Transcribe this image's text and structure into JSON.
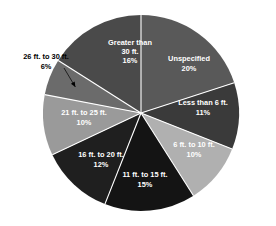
{
  "chart_data": {
    "type": "pie",
    "title": "",
    "subtitle": "",
    "xlabel": "",
    "ylabel": "",
    "legend_position": "none",
    "grid": false,
    "units": "percent",
    "start_angle_deg": -90,
    "direction": "clockwise",
    "categories": [
      "Unspecified",
      "Less than 6 ft.",
      "6 ft. to 10 ft.",
      "11 ft. to 15 ft.",
      "16 ft. to 20 ft.",
      "21 ft. to 25 ft.",
      "26 ft. to 30 ft.",
      "Greater than 30 ft."
    ],
    "values": [
      20,
      11,
      10,
      15,
      12,
      10,
      6,
      16
    ],
    "value_labels": [
      "20%",
      "11%",
      "10%",
      "15%",
      "12%",
      "10%",
      "6%",
      "16%"
    ],
    "colors": [
      "#595959",
      "#3a3a3a",
      "#b0b0b0",
      "#141414",
      "#1f1f1f",
      "#9a9a9a",
      "#6b6b6b",
      "#4a4a4a"
    ],
    "slices": [
      {
        "name": "Unspecified",
        "value": 20,
        "value_label": "20%",
        "label_lines": [
          "Unspecified",
          "20%"
        ],
        "color": "#595959",
        "label_placement": "inside",
        "label_x": 189,
        "label_y": 64
      },
      {
        "name": "Less than 6 ft.",
        "value": 11,
        "value_label": "11%",
        "label_lines": [
          "Less than 6 ft.",
          "11%"
        ],
        "color": "#3a3a3a",
        "label_placement": "inside",
        "label_x": 203,
        "label_y": 108
      },
      {
        "name": "6 ft. to 10 ft.",
        "value": 10,
        "value_label": "10%",
        "label_lines": [
          "6 ft. to 10 ft.",
          "10%"
        ],
        "color": "#b0b0b0",
        "label_placement": "inside",
        "label_x": 194,
        "label_y": 150
      },
      {
        "name": "11 ft. to 15 ft.",
        "value": 15,
        "value_label": "15%",
        "label_lines": [
          "11 ft. to 15 ft.",
          "15%"
        ],
        "color": "#141414",
        "label_placement": "inside",
        "label_x": 145,
        "label_y": 180
      },
      {
        "name": "16 ft. to 20 ft.",
        "value": 12,
        "value_label": "12%",
        "label_lines": [
          "16 ft. to 20 ft.",
          "12%"
        ],
        "color": "#1f1f1f",
        "label_placement": "inside",
        "label_x": 101,
        "label_y": 160
      },
      {
        "name": "21 ft. to 25 ft.",
        "value": 10,
        "value_label": "10%",
        "label_lines": [
          "21 ft. to 25 ft.",
          "10%"
        ],
        "color": "#9a9a9a",
        "label_placement": "inside",
        "label_x": 84,
        "label_y": 118
      },
      {
        "name": "26 ft. to 30 ft.",
        "value": 6,
        "value_label": "6%",
        "label_lines": [
          "26 ft. to 30 ft.",
          "6%"
        ],
        "color": "#6b6b6b",
        "label_placement": "outside",
        "label_x": 46,
        "label_y": 62
      },
      {
        "name": "Greater than 30 ft.",
        "value": 16,
        "value_label": "16%",
        "label_lines": [
          "Greater than",
          "30 ft.",
          "16%"
        ],
        "color": "#4a4a4a",
        "label_placement": "inside",
        "label_x": 130,
        "label_y": 52
      }
    ],
    "geometry": {
      "center_x": 141,
      "center_y": 113,
      "radius": 98
    },
    "separator_color": "#ffffff",
    "background_color": "#ffffff"
  }
}
